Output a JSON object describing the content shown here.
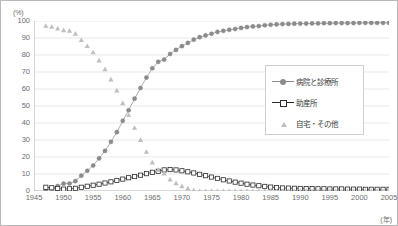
{
  "axes": {
    "y_unit": "(%)",
    "x_unit": "(年)",
    "y_ticks": [
      "100",
      "90",
      "80",
      "70",
      "60",
      "50",
      "40",
      "30",
      "20",
      "10",
      "0"
    ],
    "x_ticks": [
      "1945",
      "1950",
      "1955",
      "1960",
      "1965",
      "1970",
      "1975",
      "1980",
      "1985",
      "1990",
      "1995",
      "2000",
      "2005"
    ]
  },
  "legend": {
    "position": "right-middle",
    "items": [
      {
        "label": "病院と診療所",
        "marker": "filled-circle",
        "color": "#8c8c8c",
        "line": true
      },
      {
        "label": "助産所",
        "marker": "open-square",
        "color": "#2b2b2b",
        "line": true
      },
      {
        "label": "自宅・その他",
        "marker": "triangle",
        "color": "#bfbfbf",
        "line": false
      }
    ]
  },
  "colors": {
    "hospital": "#8c8c8c",
    "midwife_edge": "#2b2b2b",
    "midwife_fill": "#ffffff",
    "home": "#bfbfbf",
    "grid": "#e3e3e3",
    "axis": "#aeaeae",
    "text": "#6d6d6d",
    "border": "#b9b9b9"
  },
  "chart_data": {
    "type": "line",
    "title": "",
    "xlabel": "(年)",
    "ylabel": "(%)",
    "xlim": [
      1945,
      2005
    ],
    "ylim": [
      0,
      100
    ],
    "grid": true,
    "x": [
      1947,
      1948,
      1949,
      1950,
      1951,
      1952,
      1953,
      1954,
      1955,
      1956,
      1957,
      1958,
      1959,
      1960,
      1961,
      1962,
      1963,
      1964,
      1965,
      1966,
      1967,
      1968,
      1969,
      1970,
      1971,
      1972,
      1973,
      1974,
      1975,
      1976,
      1977,
      1978,
      1979,
      1980,
      1981,
      1982,
      1983,
      1984,
      1985,
      1986,
      1987,
      1988,
      1989,
      1990,
      1991,
      1992,
      1993,
      1994,
      1995,
      1996,
      1997,
      1998,
      1999,
      2000,
      2001,
      2002,
      2003,
      2004,
      2005
    ],
    "series": [
      {
        "name": "病院と診療所",
        "marker": "filled-circle",
        "color": "#8c8c8c",
        "values": [
          0.6,
          1.5,
          2.9,
          4.3,
          4.4,
          5.8,
          9.0,
          11.9,
          15.0,
          19.2,
          23.6,
          28.9,
          34.6,
          41.3,
          47.5,
          54.3,
          60.6,
          66.7,
          72.2,
          76.0,
          77.3,
          80.6,
          83.0,
          85.2,
          87.1,
          89.0,
          90.5,
          91.5,
          92.5,
          93.6,
          94.2,
          94.8,
          95.3,
          95.9,
          96.4,
          96.8,
          97.0,
          97.5,
          97.8,
          98.0,
          98.2,
          98.3,
          98.4,
          98.5,
          98.5,
          98.6,
          98.6,
          98.7,
          98.7,
          98.8,
          98.8,
          98.8,
          98.8,
          98.9,
          98.9,
          98.9,
          98.9,
          98.9,
          98.9
        ]
      },
      {
        "name": "助産所",
        "marker": "open-square",
        "color": "#2b2b2b",
        "values": [
          2.2,
          1.9,
          1.5,
          1.1,
          1.3,
          1.6,
          2.2,
          2.8,
          3.4,
          4.0,
          4.7,
          5.4,
          6.2,
          7.0,
          7.8,
          8.5,
          9.3,
          10.2,
          11.0,
          11.6,
          12.4,
          12.6,
          12.4,
          11.9,
          11.3,
          10.6,
          9.8,
          9.0,
          8.2,
          7.4,
          6.6,
          5.9,
          5.2,
          4.6,
          4.0,
          3.5,
          3.1,
          2.7,
          2.3,
          2.0,
          1.8,
          1.7,
          1.6,
          1.5,
          1.4,
          1.4,
          1.3,
          1.3,
          1.2,
          1.2,
          1.2,
          1.1,
          1.1,
          1.1,
          1.0,
          1.0,
          1.0,
          1.0,
          1.0
        ]
      },
      {
        "name": "自宅・その他",
        "marker": "triangle",
        "color": "#bfbfbf",
        "values": [
          97.2,
          96.6,
          95.6,
          94.6,
          94.3,
          92.6,
          88.8,
          85.3,
          81.6,
          76.8,
          71.7,
          65.7,
          59.2,
          51.7,
          44.7,
          37.2,
          30.1,
          23.1,
          16.8,
          12.4,
          10.3,
          6.8,
          4.6,
          2.9,
          1.6,
          0.4,
          -0.3,
          -0.5,
          -0.7,
          -1.0,
          -0.8,
          -0.7,
          -0.5,
          -0.5,
          -0.4,
          -0.3,
          -0.1,
          -0.2,
          -0.1,
          0.0,
          0.0,
          0.0,
          0.0,
          0.0,
          0.1,
          0.0,
          0.1,
          0.0,
          0.1,
          0.0,
          0.0,
          0.1,
          0.1,
          0.0,
          0.1,
          0.1,
          0.1,
          0.1,
          0.2
        ]
      }
    ]
  }
}
